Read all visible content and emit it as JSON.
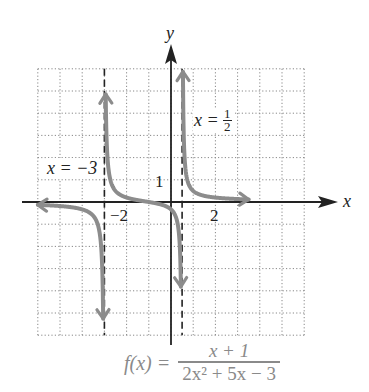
{
  "chart_data": {
    "type": "line",
    "title": "",
    "function": "f(x) = (x + 1) / (2x^2 + 5x - 3)",
    "formula": {
      "lhs": "f(x) =",
      "numerator": "x + 1",
      "denominator": "2x² + 5x − 3"
    },
    "xlabel": "x",
    "ylabel": "y",
    "xlim": [
      -6,
      6
    ],
    "ylim": [
      -6,
      6
    ],
    "grid": true,
    "grid_style": "dotted",
    "tick_labels": {
      "x": [
        {
          "value": -2,
          "label": "−2"
        },
        {
          "value": 2,
          "label": "2"
        }
      ],
      "y": [
        {
          "value": 1,
          "label": "1"
        }
      ]
    },
    "asymptotes": [
      {
        "type": "vertical",
        "x": -3,
        "label": "x = −3"
      },
      {
        "type": "vertical",
        "x": 0.5,
        "label_lhs": "x =",
        "label_num": "1",
        "label_den": "2"
      },
      {
        "type": "horizontal",
        "y": 0
      }
    ],
    "series": [
      {
        "name": "branch-left",
        "x": [
          -6,
          -5,
          -4,
          -3.5,
          -3.2,
          -3.1
        ],
        "y": [
          -0.08,
          -0.14,
          -0.33,
          -0.63,
          -1.57,
          -3.1
        ]
      },
      {
        "name": "branch-middle",
        "x": [
          -2.92,
          -2.8,
          -2.5,
          -2,
          -1,
          0,
          0.2,
          0.35,
          0.42
        ],
        "y": [
          5.8,
          1.4,
          0.5,
          0.2,
          0,
          -0.33,
          -0.66,
          -1.4,
          -2.9
        ]
      },
      {
        "name": "branch-right",
        "x": [
          0.58,
          0.65,
          0.8,
          1,
          1.5,
          2,
          2.5,
          3
        ],
        "y": [
          2.6,
          1.66,
          0.9,
          0.5,
          0.28,
          0.2,
          0.16,
          0.13
        ]
      }
    ],
    "colors": {
      "curve": "#8c8c8c",
      "axis": "#222222",
      "grid": "#888888",
      "asymptote": "#222222"
    }
  }
}
